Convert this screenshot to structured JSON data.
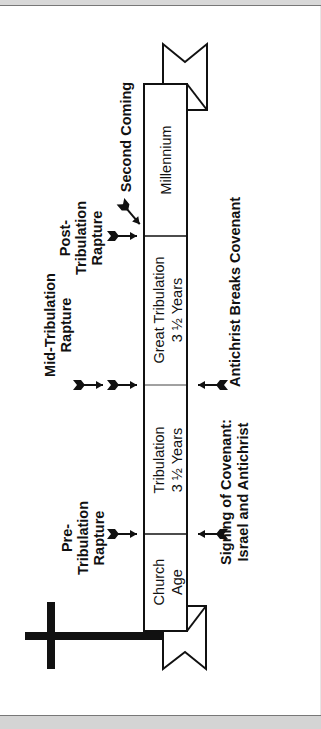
{
  "diagram": {
    "orientation": "rotated-90-ccw",
    "colors": {
      "ink": "#111111",
      "background": "#ffffff",
      "frame": "#d6d6d6"
    },
    "segments": [
      {
        "id": "church-age",
        "line1": "Church",
        "line2": "Age"
      },
      {
        "id": "tribulation",
        "line1": "Tribulation",
        "line2": "3 ½ Years"
      },
      {
        "id": "great-tribulation",
        "line1": "Great Tribulation",
        "line2": "3 ½ Years"
      },
      {
        "id": "millennium",
        "line1": "Millennium",
        "line2": ""
      }
    ],
    "rapture_labels": {
      "pre": {
        "line1": "Pre-",
        "line2": "Tribulation",
        "line3": "Rapture"
      },
      "mid": {
        "line1": "Mid-Tribulation",
        "line2": "Rapture"
      },
      "post": {
        "line1": "Post-",
        "line2": "Tribulation",
        "line3": "Rapture"
      }
    },
    "second_coming": "Second Coming",
    "events": {
      "signing": {
        "line1": "Signing of Covenant:",
        "line2": "Israel and Antichrist"
      },
      "breaks": {
        "line1": "Antichrist Breaks Covenant"
      }
    },
    "icons": [
      "cross-icon",
      "ribbon-start-icon",
      "ribbon-end-icon",
      "arrow-icon"
    ]
  }
}
